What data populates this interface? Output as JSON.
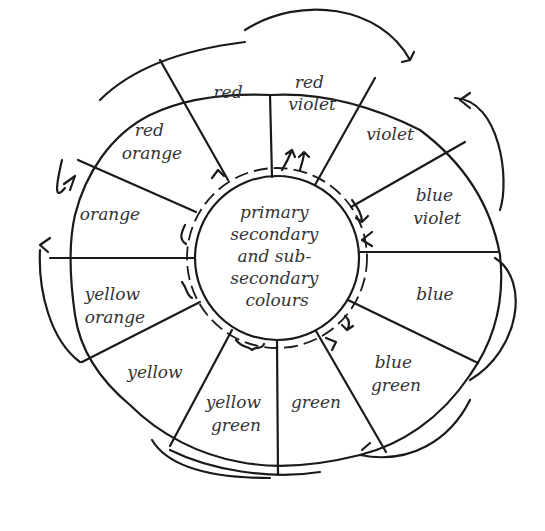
{
  "diagram": {
    "type": "colour-wheel",
    "center": {
      "lines": [
        "primary",
        "secondary",
        "and sub-",
        "secondary",
        "colours"
      ]
    },
    "segments": [
      {
        "id": "red",
        "lines": [
          "red"
        ]
      },
      {
        "id": "red-violet",
        "lines": [
          "red",
          "violet"
        ]
      },
      {
        "id": "violet",
        "lines": [
          "violet"
        ]
      },
      {
        "id": "blue-violet",
        "lines": [
          "blue",
          "violet"
        ]
      },
      {
        "id": "blue",
        "lines": [
          "blue"
        ]
      },
      {
        "id": "blue-green",
        "lines": [
          "blue",
          "green"
        ]
      },
      {
        "id": "green",
        "lines": [
          "green"
        ]
      },
      {
        "id": "yellow-green",
        "lines": [
          "yellow",
          "green"
        ]
      },
      {
        "id": "yellow",
        "lines": [
          "yellow"
        ]
      },
      {
        "id": "yellow-orange",
        "lines": [
          "yellow",
          "orange"
        ]
      },
      {
        "id": "orange",
        "lines": [
          "orange"
        ]
      },
      {
        "id": "red-orange",
        "lines": [
          "red",
          "orange"
        ]
      }
    ],
    "colors": {
      "ink": "#1a1a1a",
      "text": "#333333",
      "background": "#ffffff"
    }
  }
}
